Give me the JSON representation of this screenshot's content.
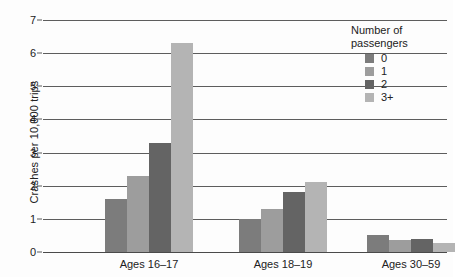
{
  "chart_data": {
    "type": "bar",
    "title": "",
    "xlabel": "",
    "ylabel": "Crashes per 10,000 trips",
    "ylim": [
      0,
      7
    ],
    "yticks": [
      0,
      1,
      2,
      3,
      4,
      5,
      6,
      7
    ],
    "ytick_labels": [
      "0",
      "1",
      "2",
      "3",
      "4",
      "5",
      "6",
      "7"
    ],
    "grid": true,
    "legend_position": "top-right",
    "legend_title": "Number of passengers",
    "categories": [
      "Ages 16–17",
      "Ages 18–19",
      "Ages 30–59"
    ],
    "series": [
      {
        "name": "0",
        "color": "#7c7c7c",
        "values": [
          1.6,
          1.0,
          0.5
        ]
      },
      {
        "name": "1",
        "color": "#9d9d9d",
        "values": [
          2.3,
          1.3,
          0.37
        ]
      },
      {
        "name": "2",
        "color": "#646464",
        "values": [
          3.3,
          1.8,
          0.38
        ]
      },
      {
        "name": "3+",
        "color": "#b4b4b4",
        "values": [
          6.3,
          2.1,
          0.28
        ]
      }
    ]
  },
  "legend": {
    "title_line1": "Number of",
    "title_line2": "passengers",
    "items": [
      {
        "label": "0"
      },
      {
        "label": "1"
      },
      {
        "label": "2"
      },
      {
        "label": "3+"
      }
    ]
  },
  "axes": {
    "y_title": "Crashes per 10,000 trips"
  }
}
